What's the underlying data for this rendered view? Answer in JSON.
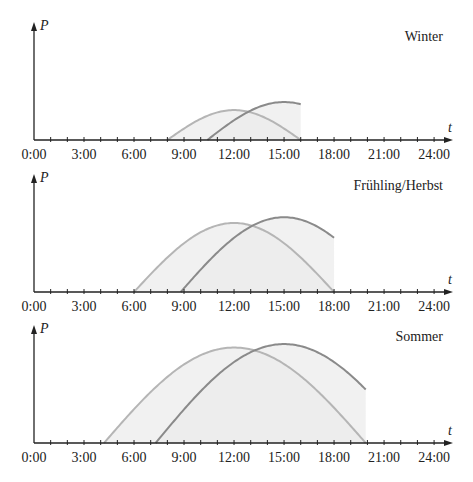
{
  "chart_data": [
    {
      "type": "line",
      "title": "Winter",
      "xlabel": "t",
      "ylabel": "P",
      "x_ticks": [
        "0:00",
        "3:00",
        "6:00",
        "9:00",
        "12:00",
        "15:00",
        "18:00",
        "21:00",
        "24:00"
      ],
      "xlim": [
        0,
        24
      ],
      "minor_tick_step_hours": 1,
      "grid": false,
      "legend": null,
      "series": [
        {
          "name": "curve-light",
          "color": "#b5b5b5",
          "start": 8.0,
          "end": 16.0,
          "peak_time": 12.0,
          "peak_rel": 0.26,
          "visible_end": 16.0
        },
        {
          "name": "curve-dark",
          "color": "#8a8a8a",
          "start": 10.4,
          "end": 19.6,
          "peak_time": 15.0,
          "peak_rel": 0.33,
          "visible_end": 16.0
        }
      ]
    },
    {
      "type": "line",
      "title": "Frühling/Herbst",
      "xlabel": "t",
      "ylabel": "P",
      "x_ticks": [
        "0:00",
        "3:00",
        "6:00",
        "9:00",
        "12:00",
        "15:00",
        "18:00",
        "21:00",
        "24:00"
      ],
      "xlim": [
        0,
        24
      ],
      "minor_tick_step_hours": 1,
      "grid": false,
      "legend": null,
      "series": [
        {
          "name": "curve-light",
          "color": "#b5b5b5",
          "start": 6.0,
          "end": 18.0,
          "peak_time": 12.0,
          "peak_rel": 0.6,
          "visible_end": 18.0
        },
        {
          "name": "curve-dark",
          "color": "#8a8a8a",
          "start": 8.8,
          "end": 21.2,
          "peak_time": 15.0,
          "peak_rel": 0.65,
          "visible_end": 18.0
        }
      ]
    },
    {
      "type": "line",
      "title": "Sommer",
      "xlabel": "t",
      "ylabel": "P",
      "x_ticks": [
        "0:00",
        "3:00",
        "6:00",
        "9:00",
        "12:00",
        "15:00",
        "18:00",
        "21:00",
        "24:00"
      ],
      "xlim": [
        0,
        24
      ],
      "minor_tick_step_hours": 1,
      "grid": false,
      "legend": null,
      "series": [
        {
          "name": "curve-light",
          "color": "#b5b5b5",
          "start": 4.2,
          "end": 19.9,
          "peak_time": 12.0,
          "peak_rel": 0.83,
          "visible_end": 19.9
        },
        {
          "name": "curve-dark",
          "color": "#8a8a8a",
          "start": 7.3,
          "end": 22.7,
          "peak_time": 15.0,
          "peak_rel": 0.86,
          "visible_end": 19.9
        }
      ]
    }
  ],
  "panels": [
    {
      "label": "Winter",
      "y_axis_label": "P",
      "x_axis_label": "t"
    },
    {
      "label": "Frühling/Herbst",
      "y_axis_label": "P",
      "x_axis_label": "t"
    },
    {
      "label": "Sommer",
      "y_axis_label": "P",
      "x_axis_label": "t"
    }
  ],
  "colors": {
    "axis": "#222222",
    "fill": "#ebebeb",
    "curve_light": "#b5b5b5",
    "curve_dark": "#8a8a8a"
  }
}
